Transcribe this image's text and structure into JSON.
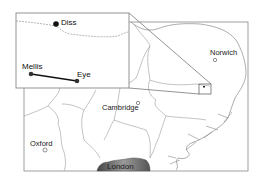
{
  "map": {
    "title": "",
    "main_cities": [
      {
        "name": "Norwich",
        "x": 214,
        "y": 50
      },
      {
        "name": "Cambridge",
        "x": 137,
        "y": 104
      },
      {
        "name": "Oxford",
        "x": 45,
        "y": 141
      },
      {
        "name": "London",
        "x": 123,
        "y": 166
      }
    ],
    "inset": {
      "places": [
        {
          "name": "Diss",
          "x": 56,
          "y": 24
        },
        {
          "name": "Mellis",
          "x": 31,
          "y": 74
        },
        {
          "name": "Eye",
          "x": 77,
          "y": 81
        }
      ],
      "route": {
        "from": "Mellis",
        "to": "Eye"
      }
    },
    "colors": {
      "frame": "#888888",
      "boundary": "#999999",
      "marker": "#111111",
      "london_fill_dark": "#444444",
      "london_fill_light": "#bbbbbb"
    }
  }
}
